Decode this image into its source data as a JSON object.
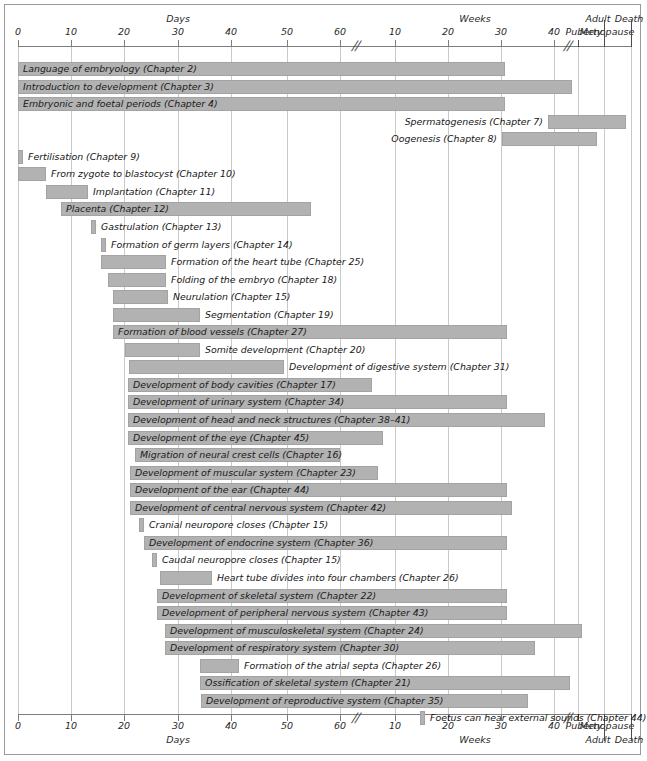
{
  "figure": {
    "kind": "developmental-timeline-gantt",
    "bar_color": "#b2b2b2",
    "grid_color": "#c9c9c9",
    "axis_color": "#7d7d7d"
  },
  "axis": {
    "unit_top_left": "Days",
    "unit_top_right": "Weeks",
    "unit_bottom_left": "Days",
    "unit_bottom_right": "Weeks",
    "break_symbol": "//",
    "ticks": [
      {
        "label": "0",
        "x": 18
      },
      {
        "label": "10",
        "x": 71
      },
      {
        "label": "20",
        "x": 124
      },
      {
        "label": "30",
        "x": 178
      },
      {
        "label": "40",
        "x": 231
      },
      {
        "label": "50",
        "x": 287
      },
      {
        "label": "60",
        "x": 340
      },
      {
        "label": "10",
        "x": 395
      },
      {
        "label": "20",
        "x": 448
      },
      {
        "label": "30",
        "x": 501
      },
      {
        "label": "40",
        "x": 554
      }
    ],
    "stage_labels_top": [
      {
        "label": "Puberty",
        "x": 584,
        "y": 26
      },
      {
        "label": "Adult",
        "x": 598,
        "y": 13
      },
      {
        "label": "Menopause",
        "x": 607,
        "y": 26
      },
      {
        "label": "Death",
        "x": 629,
        "y": 13
      }
    ],
    "stage_labels_bottom": [
      {
        "label": "Puberty",
        "x": 584,
        "y": 720
      },
      {
        "label": "Adult",
        "x": 598,
        "y": 734
      },
      {
        "label": "Menopause",
        "x": 607,
        "y": 720
      },
      {
        "label": "Death",
        "x": 629,
        "y": 734
      }
    ],
    "breaks": [
      {
        "x": 356,
        "y_top": 38,
        "y_bottom": 710
      },
      {
        "x": 568,
        "y_top": 38,
        "y_bottom": 710
      }
    ],
    "separators": [
      {
        "x": 578,
        "top": 40,
        "height": 7
      },
      {
        "x": 578,
        "top": 714,
        "height": 7
      },
      {
        "x": 604,
        "top": 20,
        "height": 27
      },
      {
        "x": 604,
        "top": 714,
        "height": 27
      },
      {
        "x": 631,
        "top": 20,
        "height": 27
      },
      {
        "x": 631,
        "top": 714,
        "height": 27
      }
    ],
    "gridlines_x": [
      18,
      71,
      124,
      178,
      231,
      287,
      340,
      395,
      448,
      501,
      554,
      578,
      604,
      631
    ]
  },
  "chart_data": {
    "type": "bar",
    "xlabel": "Days / Weeks / Puberty / Adult / Menopause / Death",
    "ylabel": "",
    "bars": [
      {
        "label": "Language of embryology (Chapter 2)",
        "x": 18,
        "w": 487,
        "label_pos": "inside-left"
      },
      {
        "label": "Introduction to development (Chapter 3)",
        "x": 18,
        "w": 554,
        "label_pos": "inside-left"
      },
      {
        "label": "Embryonic and foetal periods (Chapter 4)",
        "x": 18,
        "w": 487,
        "label_pos": "inside-left"
      },
      {
        "label": "Spermatogenesis (Chapter 7)",
        "x": 548,
        "w": 78,
        "label_pos": "outside-left"
      },
      {
        "label": "Oogenesis (Chapter 8)",
        "x": 502,
        "w": 95,
        "label_pos": "outside-left"
      },
      {
        "label": "Fertilisation (Chapter 9)",
        "x": 18,
        "w": 5,
        "label_pos": "outside-right"
      },
      {
        "label": "From zygote to blastocyst (Chapter 10)",
        "x": 18,
        "w": 28,
        "label_pos": "outside-right"
      },
      {
        "label": "Implantation (Chapter 11)",
        "x": 46,
        "w": 42,
        "label_pos": "outside-right"
      },
      {
        "label": "Placenta (Chapter 12)",
        "x": 61,
        "w": 250,
        "label_pos": "inside-left"
      },
      {
        "label": "Gastrulation (Chapter 13)",
        "x": 91,
        "w": 5,
        "label_pos": "outside-right"
      },
      {
        "label": "Formation of germ layers (Chapter 14)",
        "x": 101,
        "w": 5,
        "label_pos": "outside-right"
      },
      {
        "label": "Formation of the heart tube (Chapter 25)",
        "x": 101,
        "w": 65,
        "label_pos": "outside-right"
      },
      {
        "label": "Folding of the embryo (Chapter 18)",
        "x": 108,
        "w": 58,
        "label_pos": "outside-right"
      },
      {
        "label": "Neurulation (Chapter 15)",
        "x": 113,
        "w": 55,
        "label_pos": "outside-right"
      },
      {
        "label": "Segmentation (Chapter 19)",
        "x": 113,
        "w": 87,
        "label_pos": "outside-right"
      },
      {
        "label": "Formation of blood vessels (Chapter 27)",
        "x": 113,
        "w": 394,
        "label_pos": "inside-left"
      },
      {
        "label": "Somite development (Chapter 20)",
        "x": 125,
        "w": 75,
        "label_pos": "outside-right"
      },
      {
        "label": "Development of digestive system (Chapter 31)",
        "x": 129,
        "w": 155,
        "label_pos": "outside-right"
      },
      {
        "label": "Development of body cavities (Chapter 17)",
        "x": 128,
        "w": 244,
        "label_pos": "inside-left"
      },
      {
        "label": "Development of urinary system (Chapter 34)",
        "x": 128,
        "w": 379,
        "label_pos": "inside-left"
      },
      {
        "label": "Development of head and neck structures (Chapter 38–41)",
        "x": 128,
        "w": 417,
        "label_pos": "inside-left"
      },
      {
        "label": "Development of the eye (Chapter 45)",
        "x": 128,
        "w": 255,
        "label_pos": "inside-left"
      },
      {
        "label": "Migration of neural crest cells (Chapter 16)",
        "x": 135,
        "w": 205,
        "label_pos": "inside-left"
      },
      {
        "label": "Development of muscular system (Chapter 23)",
        "x": 130,
        "w": 248,
        "label_pos": "inside-left"
      },
      {
        "label": "Development of the ear (Chapter 44)",
        "x": 130,
        "w": 377,
        "label_pos": "inside-left"
      },
      {
        "label": "Development of central nervous system (Chapter 42)",
        "x": 130,
        "w": 382,
        "label_pos": "inside-left"
      },
      {
        "label": "Cranial neuropore closes (Chapter 15)",
        "x": 139,
        "w": 5,
        "label_pos": "outside-right"
      },
      {
        "label": "Development of endocrine system (Chapter 36)",
        "x": 144,
        "w": 363,
        "label_pos": "inside-left"
      },
      {
        "label": "Caudal neuropore closes (Chapter 15)",
        "x": 152,
        "w": 5,
        "label_pos": "outside-right"
      },
      {
        "label": "Heart tube divides into four chambers (Chapter 26)",
        "x": 160,
        "w": 52,
        "label_pos": "outside-right"
      },
      {
        "label": "Development of skeletal system (Chapter 22)",
        "x": 157,
        "w": 350,
        "label_pos": "inside-left"
      },
      {
        "label": "Development of peripheral nervous system (Chapter 43)",
        "x": 157,
        "w": 350,
        "label_pos": "inside-left"
      },
      {
        "label": "Development of musculoskeletal system (Chapter 24)",
        "x": 165,
        "w": 417,
        "label_pos": "inside-left"
      },
      {
        "label": "Development of respiratory system (Chapter 30)",
        "x": 165,
        "w": 370,
        "label_pos": "inside-left"
      },
      {
        "label": "Formation of the atrial septa (Chapter 26)",
        "x": 200,
        "w": 39,
        "label_pos": "outside-right"
      },
      {
        "label": "Ossification of skeletal system (Chapter 21)",
        "x": 200,
        "w": 370,
        "label_pos": "inside-left"
      },
      {
        "label": "Development of reproductive system (Chapter 35)",
        "x": 201,
        "w": 327,
        "label_pos": "inside-left"
      },
      {
        "label": "Foetus can hear external sounds (Chapter 44)",
        "x": 420,
        "w": 5,
        "label_pos": "outside-right"
      }
    ],
    "row_top_start": 62,
    "row_step": 17.55,
    "bar_height": 14
  }
}
